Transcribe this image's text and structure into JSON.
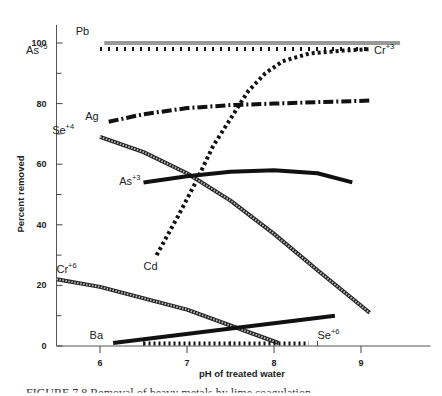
{
  "chart_data": {
    "type": "line",
    "title": "",
    "xlabel": "pH of treated water",
    "ylabel": "Percent removed",
    "xlim": [
      5.5,
      9.8
    ],
    "ylim": [
      0,
      105
    ],
    "xticks": [
      6,
      7,
      8,
      9
    ],
    "xticks_minor": [
      6.5,
      7.5,
      8.5
    ],
    "yticks": [
      0,
      20,
      40,
      60,
      80,
      100
    ],
    "yticks_minor": [
      10,
      30,
      50,
      70,
      90
    ],
    "grid": false,
    "legend": "inline labels",
    "series": [
      {
        "name": "Pb",
        "sup": "",
        "style": "gray-double",
        "label_pos": [
          5.72,
          102.5
        ],
        "x": [
          6.05,
          9.45
        ],
        "y": [
          100,
          100
        ]
      },
      {
        "name": "As",
        "sup": "+5",
        "style": "dotted-ticks",
        "label_pos": [
          5.15,
          96.5
        ],
        "x": [
          6.0,
          9.1
        ],
        "y": [
          98,
          98
        ]
      },
      {
        "name": "Cr",
        "sup": "+3",
        "style": "square-dots",
        "label_pos": [
          9.15,
          96.5
        ],
        "x": [
          6.65,
          6.9,
          7.1,
          7.3,
          7.5,
          7.7,
          7.9,
          8.1,
          8.4,
          8.8,
          9.1
        ],
        "y": [
          30,
          43,
          54,
          66,
          75,
          84,
          90,
          94,
          96.5,
          97.5,
          98
        ]
      },
      {
        "name": "Ag",
        "sup": "",
        "style": "dash-dot",
        "label_pos": [
          5.83,
          74.5
        ],
        "x": [
          6.1,
          6.5,
          7.0,
          7.5,
          8.0,
          8.5,
          9.1
        ],
        "y": [
          74,
          76.5,
          78.5,
          79.5,
          80,
          80.5,
          81
        ]
      },
      {
        "name": "Se",
        "sup": "+4",
        "style": "hatched-gray",
        "label_pos": [
          5.45,
          70
        ],
        "x": [
          6.0,
          6.5,
          7.0,
          7.5,
          8.0,
          8.5,
          9.1
        ],
        "y": [
          69,
          64,
          57,
          48,
          37,
          25,
          11
        ]
      },
      {
        "name": "As",
        "sup": "+3",
        "style": "solid-thick",
        "label_pos": [
          6.22,
          53
        ],
        "x": [
          6.5,
          7.0,
          7.5,
          8.0,
          8.5,
          8.9
        ],
        "y": [
          54,
          56,
          57.5,
          58,
          57,
          54
        ]
      },
      {
        "name": "Cr",
        "sup": "+6",
        "style": "hatched-gray",
        "label_pos": [
          5.5,
          24
        ],
        "x": [
          5.5,
          6.0,
          7.0,
          8.05
        ],
        "y": [
          22,
          19.5,
          12,
          1
        ]
      },
      {
        "name": "Ba",
        "sup": "",
        "style": "solid-thick",
        "label_pos": [
          5.88,
          2.2
        ],
        "x": [
          6.15,
          8.7
        ],
        "y": [
          1,
          10
        ]
      },
      {
        "name": "Se",
        "sup": "+6",
        "style": "hatched-base",
        "label_pos": [
          8.5,
          2.2
        ],
        "x": [
          6.5,
          8.4
        ],
        "y": [
          0.8,
          0.8
        ]
      },
      {
        "name": "Cd",
        "sup": "",
        "style": "label-only",
        "label_pos": [
          6.5,
          25
        ],
        "x": [],
        "y": []
      }
    ]
  },
  "caption": "FIGURE 7.8  Removal of heavy metals by lime coagulation"
}
